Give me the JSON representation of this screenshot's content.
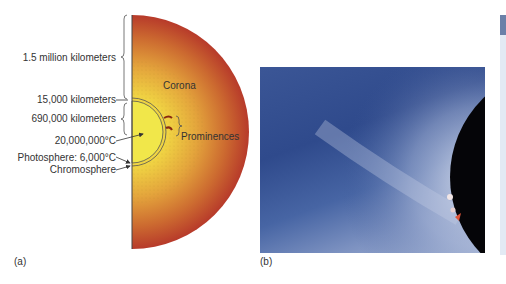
{
  "figure_a": {
    "panel_label": "(a)",
    "labels": {
      "corona_extent": "1.5 million kilometers",
      "chromosphere_thickness": "15,000 kilometers",
      "photosphere_radius": "690,000 kilometers",
      "corona_temp": "20,000,000°C",
      "photosphere": "Photosphere: 6,000°C",
      "chromosphere": "Chromosphere",
      "corona": "Corona",
      "prominences": "Prominences"
    },
    "colors": {
      "outer_corona": "#b8382a",
      "mid_corona": "#e3a53a",
      "inner": "#f2e13c"
    }
  },
  "figure_b": {
    "panel_label": "(b)",
    "colors": {
      "sky": "#34508f",
      "streamer": "#b8c4df",
      "disk": "#050508",
      "prominence": "#e0553a"
    }
  }
}
